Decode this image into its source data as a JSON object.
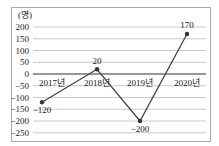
{
  "chart_data": {
    "type": "line",
    "title": "",
    "ylabel": "(명)",
    "xlabel": "",
    "categories": [
      "2017년",
      "2018년",
      "2019년",
      "2020년"
    ],
    "series": [
      {
        "name": "",
        "values": [
          -120,
          20,
          -200,
          170
        ]
      }
    ],
    "data_labels": [
      "−120",
      "20",
      "−200",
      "170"
    ],
    "ylim": [
      -250,
      200
    ],
    "yticks": [
      200,
      150,
      100,
      50,
      0,
      -50,
      -100,
      -150,
      -200,
      -250
    ],
    "ytick_labels": [
      "200",
      "150",
      "100",
      "50",
      "0",
      "−50",
      "−100",
      "−150",
      "−200",
      "−250"
    ],
    "grid": true,
    "legend": "none"
  }
}
